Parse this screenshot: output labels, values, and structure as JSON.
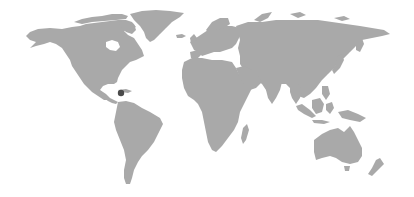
{
  "map": {
    "land_color": "#a9a9a9",
    "background_color": "#ffffff",
    "marker_color": "#4a4a4a",
    "marker": {
      "label": "",
      "region": "Caribbean",
      "x": 121,
      "y": 93,
      "r": 3.2
    },
    "regions": [
      "North America",
      "Greenland",
      "South America",
      "Europe",
      "Africa",
      "Asia",
      "Australia",
      "New Zealand",
      "Maritime Southeast Asia"
    ]
  }
}
